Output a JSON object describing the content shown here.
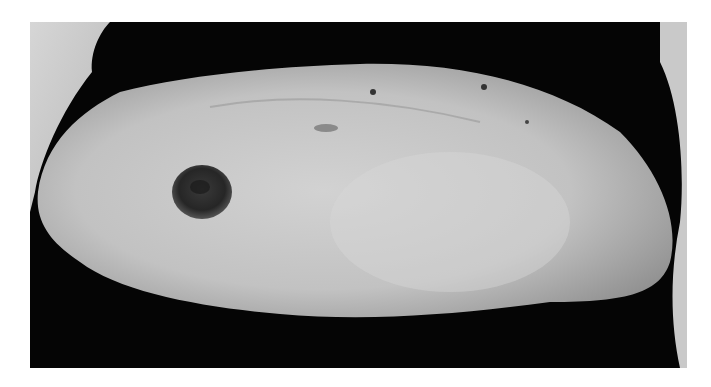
{
  "image": {
    "subject": "abdomen with stoma",
    "style": "grayscale photograph",
    "colors": {
      "page_background": "#ffffff",
      "background_cloth": "#050505",
      "skin_light": "#cfcfcf",
      "skin_mid": "#a9a9a9",
      "stoma": "#2a2a2a",
      "sheet_left": "#c8c8c8"
    }
  }
}
